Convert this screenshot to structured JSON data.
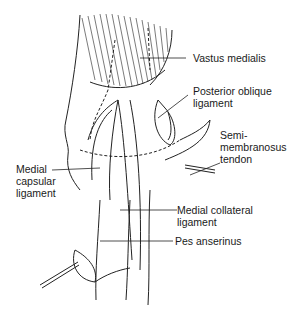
{
  "diagram": {
    "type": "anatomical illustration",
    "labels": [
      {
        "id": "vastus-medialis",
        "text": "Vastus medialis"
      },
      {
        "id": "posterior-oblique-ligament",
        "text": "Posterior oblique\nligament"
      },
      {
        "id": "semimembranosus-tendon",
        "text": "Semi-\nmembranosus\ntendon"
      },
      {
        "id": "medial-capsular-ligament",
        "text": "Medial\ncapsular\nligament"
      },
      {
        "id": "medial-collateral-ligament",
        "text": "Medial collateral\nligament"
      },
      {
        "id": "pes-anserinus",
        "text": "Pes anserinus"
      }
    ]
  }
}
